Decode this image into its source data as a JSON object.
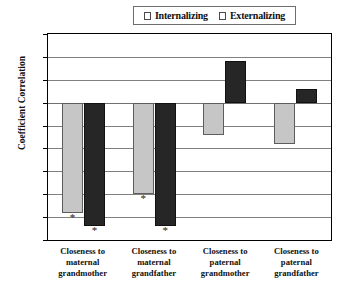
{
  "chart_data": {
    "type": "bar",
    "title": "",
    "xlabel": "",
    "ylabel": "Coefficient Correlation",
    "ylim": [
      -0.3,
      0.15
    ],
    "ytick_values": [
      0.15,
      0.1,
      0.05,
      0,
      -0.05,
      -0.1,
      -0.15,
      -0.2,
      -0.25,
      -0.3
    ],
    "ytick_labels": [
      "0.15",
      "0.10",
      "0.05",
      "0",
      "-0.05",
      "-0.10",
      "-0.15",
      "-0.20",
      "-0.25",
      "-0.30"
    ],
    "grid": true,
    "legend_position": "top-center",
    "categories": [
      "Closeness to maternal grandmother",
      "Closeness to maternal grandfather",
      "Closeness to paternal grandmother",
      "Closeness to paternal grandfather"
    ],
    "category_lines": [
      [
        "Closeness to",
        "maternal",
        "grandmother"
      ],
      [
        "Closeness to",
        "maternal",
        "grandfather"
      ],
      [
        "Closeness to",
        "paternal",
        "grandmother"
      ],
      [
        "Closeness to",
        "paternal",
        "grandfather"
      ]
    ],
    "series": [
      {
        "name": "Internalizing",
        "color": "#c6c6c6",
        "values": [
          -0.24,
          -0.2,
          -0.07,
          -0.09
        ],
        "significant": [
          true,
          true,
          false,
          false
        ]
      },
      {
        "name": "Externalizing",
        "color": "#262626",
        "values": [
          -0.27,
          -0.27,
          0.09,
          0.03
        ],
        "significant": [
          true,
          true,
          false,
          false
        ]
      }
    ],
    "significance_marker": "*"
  },
  "legend": {
    "items": [
      {
        "label": "Internalizing",
        "swatch": "light-gray-square"
      },
      {
        "label": "Externalizing",
        "swatch": "black-square"
      }
    ]
  }
}
